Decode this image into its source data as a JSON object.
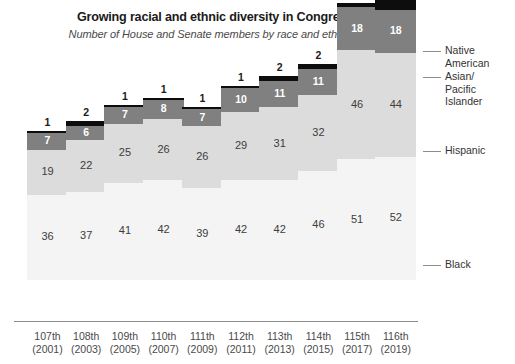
{
  "chart_data": {
    "type": "bar",
    "subtype": "stacked-bar",
    "title": "Growing racial and ethnic diversity in Congress",
    "subtitle": "Number of House and Senate members by race and ethnicity",
    "xlabel": "",
    "ylabel": "",
    "grid": false,
    "legend_position": "right",
    "categories": [
      "107th\n(2001)",
      "108th\n(2003)",
      "109th\n(2005)",
      "110th\n(2007)",
      "111th\n(2009)",
      "112th\n(2011)",
      "113th\n(2013)",
      "114th\n(2015)",
      "115th\n(2017)",
      "116th\n(2019)"
    ],
    "category_numbers": [
      "107th",
      "108th",
      "109th",
      "110th",
      "111th",
      "112th",
      "113th",
      "114th",
      "115th",
      "116th"
    ],
    "category_years": [
      "(2001)",
      "(2003)",
      "(2005)",
      "(2007)",
      "(2009)",
      "(2011)",
      "(2013)",
      "(2015)",
      "(2017)",
      "(2019)"
    ],
    "series": [
      {
        "name": "Black",
        "color": "#f4f4f4",
        "values": [
          36,
          37,
          41,
          42,
          39,
          42,
          42,
          46,
          51,
          52
        ]
      },
      {
        "name": "Hispanic",
        "color": "#dcdcdc",
        "values": [
          19,
          22,
          25,
          26,
          26,
          29,
          31,
          32,
          46,
          44
        ]
      },
      {
        "name": "Asian/\nPacific\nIslander",
        "color": "#808080",
        "values": [
          7,
          6,
          7,
          8,
          7,
          10,
          11,
          11,
          18,
          18
        ]
      },
      {
        "name": "Native\nAmerican",
        "color": "#0d0d0d",
        "values": [
          1,
          2,
          1,
          1,
          1,
          1,
          2,
          2,
          2,
          4
        ]
      }
    ],
    "totals": [
      63,
      67,
      74,
      77,
      73,
      82,
      86,
      91,
      117,
      118
    ],
    "ylim": [
      0,
      118
    ]
  },
  "legend": {
    "native_american": "Native\nAmerican",
    "asian_pacific_islander": "Asian/\nPacific\nIslander",
    "hispanic": "Hispanic",
    "black": "Black"
  },
  "colors": {
    "native_american": "#0d0d0d",
    "asian_pacific_islander": "#808080",
    "hispanic": "#dcdcdc",
    "black": "#f4f4f4",
    "axis": "#8c8c8c",
    "title_text": "#1a1a1a",
    "label_text": "#3d3d3d"
  }
}
